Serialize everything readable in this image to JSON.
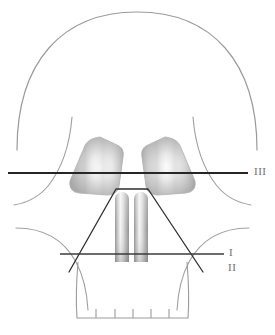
{
  "figure": {
    "kind": "anatomical-line-diagram",
    "background_color": "#ffffff",
    "width": 275,
    "height": 335
  },
  "labels": {
    "line_one": "I",
    "line_two": "II",
    "line_three": "III"
  },
  "reference_lines": [
    {
      "id": "line-three",
      "label": "III",
      "orientation": "horizontal",
      "color": "#262626",
      "y": 173,
      "x_start": 8,
      "x_end": 248,
      "label_x": 254,
      "label_y": 166,
      "passes_through": "orbits"
    },
    {
      "id": "line-one",
      "label": "I",
      "orientation": "horizontal",
      "color": "#3a3a3a",
      "y": 254,
      "x_start": 60,
      "x_end": 224,
      "label_x": 229,
      "label_y": 247,
      "passes_through": "nasal-base"
    },
    {
      "id": "line-two",
      "label": "II",
      "orientation": "crossed-diagonals",
      "color": "#2e2e2e",
      "label_x": 228,
      "label_y": 262,
      "passes_through": "nasal-aperture-sides"
    }
  ],
  "anatomy": {
    "cranium": {
      "name": "cranial-vault",
      "stroke": "#9b9b9b",
      "stroke_width": 1.1
    },
    "temporal_lines": {
      "name": "temporal-lines",
      "stroke": "#a0a0a0",
      "count": 2
    },
    "zygomatic_arches": {
      "name": "zygomatic-arches",
      "stroke": "#a0a0a0",
      "count": 2
    },
    "cheek_curves": {
      "name": "cheek-curves",
      "stroke": "#a0a0a0",
      "count": 2
    },
    "orbits": {
      "name": "orbital-sockets",
      "count": 2,
      "fill_light": "#ffffff",
      "fill_mid": "#c9c9c9",
      "fill_dark": "#9a9a9a",
      "stroke": "#b4b4b4"
    },
    "nasal_aperture": {
      "name": "nasal-aperture",
      "shape": "trapezoid",
      "stroke": "#3a3a3a"
    },
    "nasal_turbinates": {
      "name": "nasal-turbinates",
      "count": 2,
      "fill_light": "#f2f2f2",
      "fill_mid": "#bdbdbd",
      "fill_dark": "#8f8f8f"
    },
    "maxilla": {
      "name": "maxilla-dental-arch",
      "stroke": "#9b9b9b",
      "tooth_marks": 5
    }
  },
  "palette": {
    "outline_gray": "#9b9b9b",
    "line_dark": "#262626",
    "label_gray": "#6f6f6f",
    "shade_mid": "#c9c9c9",
    "shade_dark": "#8f8f8f",
    "white": "#ffffff"
  }
}
